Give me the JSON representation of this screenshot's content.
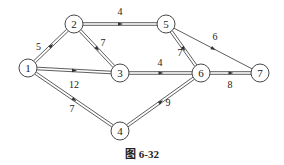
{
  "diagram": {
    "type": "network-graph",
    "colors": {
      "stroke": "#333333",
      "background": "#ffffff",
      "text": "#222222"
    },
    "nodes": [
      {
        "id": "1",
        "label": "1",
        "x": 28,
        "y": 68
      },
      {
        "id": "2",
        "label": "2",
        "x": 74,
        "y": 24
      },
      {
        "id": "3",
        "label": "3",
        "x": 120,
        "y": 73
      },
      {
        "id": "4",
        "label": "4",
        "x": 120,
        "y": 131
      },
      {
        "id": "5",
        "label": "5",
        "x": 166,
        "y": 24
      },
      {
        "id": "6",
        "label": "6",
        "x": 201,
        "y": 73
      },
      {
        "id": "7",
        "label": "7",
        "x": 260,
        "y": 73
      }
    ],
    "edges": [
      {
        "from": "1",
        "to": "2",
        "weight": "5",
        "double": true,
        "lx": 36,
        "ly": 50,
        "la": "start"
      },
      {
        "from": "1",
        "to": "3",
        "weight": "12",
        "double": true,
        "lx": 74,
        "ly": 88,
        "la": "middle"
      },
      {
        "from": "1",
        "to": "4",
        "weight": "7",
        "double": true,
        "lx": 72,
        "ly": 112,
        "la": "middle"
      },
      {
        "from": "2",
        "to": "5",
        "weight": "4",
        "double": true,
        "lx": 120,
        "ly": 15,
        "la": "middle"
      },
      {
        "from": "2",
        "to": "3",
        "weight": "7",
        "double": true,
        "lx": 103,
        "ly": 46,
        "la": "middle"
      },
      {
        "from": "3",
        "to": "6",
        "weight": "4",
        "double": true,
        "lx": 160,
        "ly": 66,
        "la": "middle"
      },
      {
        "from": "4",
        "to": "6",
        "weight": "9",
        "double": true,
        "lx": 168,
        "ly": 106,
        "la": "middle"
      },
      {
        "from": "5",
        "to": "6",
        "weight": "7",
        "double": true,
        "lx": 180,
        "ly": 56,
        "la": "middle"
      },
      {
        "from": "5",
        "to": "7",
        "weight": "6",
        "double": false,
        "lx": 215,
        "ly": 40,
        "la": "middle"
      },
      {
        "from": "6",
        "to": "7",
        "weight": "8",
        "double": true,
        "lx": 230,
        "ly": 88,
        "la": "middle"
      }
    ],
    "node_radius": 9
  },
  "caption": "图 6-32"
}
